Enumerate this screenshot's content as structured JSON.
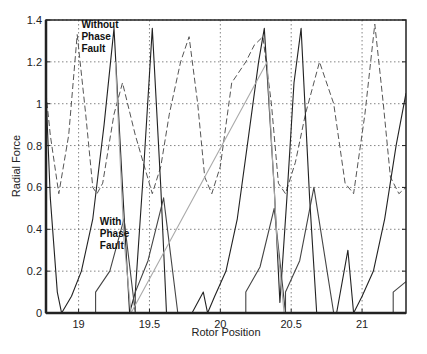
{
  "chart_data": {
    "type": "line",
    "title": "",
    "xlabel": "Rotor Position",
    "ylabel": "Radial Force",
    "xlim": [
      18.77,
      21.31
    ],
    "ylim": [
      0,
      1.4
    ],
    "xticks": [
      19,
      19.5,
      20,
      20.5,
      21
    ],
    "xtick_labels": [
      "19",
      "19.5",
      "20",
      "20.5",
      "21"
    ],
    "yticks": [
      0,
      0.2,
      0.4,
      0.6,
      0.8,
      1,
      1.2,
      1.4
    ],
    "ytick_labels": [
      "0",
      "0.2",
      "0.4",
      "0.6",
      "0.8",
      "1",
      "1.2",
      "1.4"
    ],
    "grid": true,
    "legend": null,
    "annotations": [
      {
        "text": [
          "Without",
          "Phase",
          "Fault"
        ],
        "x": 19.02,
        "y": 1.36
      },
      {
        "text": [
          "With",
          "Phase",
          "Fault"
        ],
        "x": 19.15,
        "y": 0.42
      }
    ],
    "series": [
      {
        "name": "Without Phase Fault",
        "style": "dashed",
        "color": "#555555",
        "peaks_x": [
          18.99,
          19.78,
          20.3,
          21.09
        ],
        "peak_y": 1.33,
        "trough_y": 0.57,
        "x": [
          18.77,
          18.8,
          18.86,
          18.93,
          18.99,
          19.05,
          19.1,
          19.13,
          19.17,
          19.25,
          19.31,
          19.4,
          19.52,
          19.58,
          19.64,
          19.72,
          19.78,
          19.84,
          19.89,
          19.94,
          20.0,
          20.08,
          20.18,
          20.24,
          20.3,
          20.36,
          20.41,
          20.46,
          20.53,
          20.6,
          20.7,
          20.8,
          20.88,
          20.94,
          21.02,
          21.09,
          21.15,
          21.2,
          21.26,
          21.31
        ],
        "y": [
          1.05,
          0.85,
          0.57,
          0.85,
          1.33,
          0.95,
          0.6,
          0.57,
          0.62,
          0.95,
          1.1,
          0.85,
          0.57,
          0.7,
          0.95,
          1.2,
          1.32,
          1.0,
          0.65,
          0.57,
          0.7,
          1.1,
          1.2,
          1.28,
          1.32,
          1.0,
          0.62,
          0.57,
          0.72,
          0.95,
          1.2,
          1.0,
          0.62,
          0.57,
          0.95,
          1.38,
          1.0,
          0.65,
          0.57,
          0.6
        ]
      },
      {
        "name": "With Phase Fault",
        "style": "solid",
        "color": "#222222",
        "peaks_x": [
          19.25,
          19.52,
          20.31,
          20.57
        ],
        "peak_y": 1.36,
        "x": [
          18.77,
          18.8,
          18.85,
          18.88,
          18.95,
          19.02,
          19.1,
          19.18,
          19.25,
          19.31,
          19.36,
          19.4,
          19.46,
          19.52,
          19.58,
          19.62,
          19.66,
          19.72,
          19.8,
          19.88,
          19.91,
          19.96,
          20.04,
          20.12,
          20.2,
          20.27,
          20.31,
          20.38,
          20.42,
          20.47,
          20.52,
          20.57,
          20.63,
          20.68,
          20.75,
          20.82,
          20.9,
          20.94,
          21.0,
          21.08,
          21.16,
          21.24,
          21.31
        ],
        "y": [
          1.05,
          0.55,
          0.1,
          0.0,
          0.08,
          0.2,
          0.45,
          0.9,
          1.36,
          0.6,
          0.0,
          0.1,
          0.7,
          1.36,
          0.6,
          0.0,
          0.0,
          0.0,
          0.0,
          0.1,
          0.0,
          0.08,
          0.2,
          0.45,
          0.85,
          1.2,
          1.36,
          0.6,
          0.05,
          0.55,
          1.1,
          1.36,
          0.55,
          0.0,
          0.0,
          0.0,
          0.3,
          0.0,
          0.08,
          0.2,
          0.45,
          0.8,
          1.05
        ]
      },
      {
        "name": "With Phase Fault (rising phase)",
        "style": "solid",
        "color": "#444444",
        "x": [
          19.12,
          19.12,
          19.22,
          19.32,
          19.4,
          19.4,
          19.49,
          19.6,
          19.7,
          20.18,
          20.18,
          20.28,
          20.38,
          20.46,
          20.46,
          20.56,
          20.66,
          20.8,
          21.22,
          21.22,
          21.31
        ],
        "y": [
          0.0,
          0.1,
          0.2,
          0.45,
          0.0,
          0.1,
          0.25,
          0.55,
          0.0,
          0.0,
          0.1,
          0.22,
          0.5,
          0.0,
          0.1,
          0.25,
          0.6,
          0.0,
          0.0,
          0.1,
          0.15
        ]
      },
      {
        "name": "With Phase Fault (faulted phase, light)",
        "style": "solid",
        "color": "#aaaaaa",
        "x": [
          19.26,
          19.32,
          19.37,
          20.33,
          20.4,
          20.45
        ],
        "y": [
          1.2,
          0.35,
          0.0,
          1.2,
          0.35,
          0.0
        ]
      }
    ]
  }
}
